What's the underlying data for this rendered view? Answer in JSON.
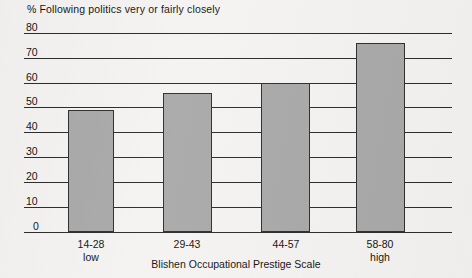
{
  "chart_data": {
    "type": "bar",
    "title": "% Following politics very or  fairly closely",
    "xlabel": "Blishen Occupational Prestige Scale",
    "ylabel": "",
    "categories": [
      "14-28\nlow",
      "29-43",
      "44-57",
      "58-80\nhigh"
    ],
    "category_lines": [
      {
        "range": "14-28",
        "qualifier": "low"
      },
      {
        "range": "29-43",
        "qualifier": ""
      },
      {
        "range": "44-57",
        "qualifier": ""
      },
      {
        "range": "58-80",
        "qualifier": "high"
      }
    ],
    "values": [
      49,
      56,
      60,
      76
    ],
    "ylim": [
      0,
      80
    ],
    "ytick_labels": [
      "80",
      "70",
      "60",
      "50",
      "40",
      "30",
      "20",
      "10",
      "0"
    ],
    "ytick_values": [
      80,
      70,
      60,
      50,
      40,
      30,
      20,
      10,
      0
    ],
    "grid": true,
    "legend": "none",
    "bar_color": "#a9a9a9",
    "bar_border_color": "#2f2f2f",
    "gridline_color": "#2b2b2b",
    "background_color": "#f4f3f1"
  }
}
